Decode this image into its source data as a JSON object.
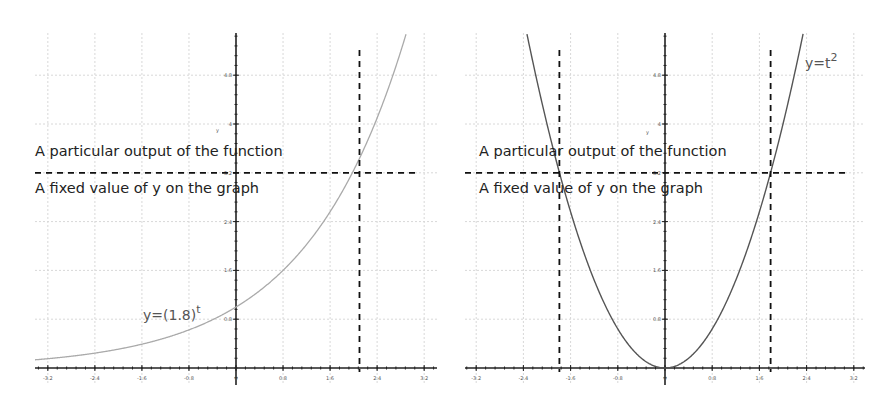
{
  "chart_data": [
    {
      "type": "line",
      "title": "",
      "function_label": "y=(1.8)",
      "function_exponent": "t",
      "xlabel": "",
      "ylabel": "y",
      "x_ticks": [
        "-3.2",
        "-2.4",
        "-1.6",
        "-0.8",
        "0",
        "0.8",
        "1.6",
        "2.4",
        "3.2"
      ],
      "y_ticks": [
        "0.8",
        "1.6",
        "2.4",
        "3.2",
        "4",
        "4.8"
      ],
      "xlim": [
        -4.0,
        4.3
      ],
      "ylim": [
        -0.2,
        6.0
      ],
      "series": [
        {
          "name": "y=(1.8)^t",
          "formula": "1.8^t",
          "color": "#aaaaaa"
        }
      ],
      "horizontal_line": {
        "y": 3.2,
        "style": "dashed"
      },
      "vertical_lines": [
        {
          "x": 2.1,
          "style": "dashed"
        }
      ],
      "annotations": [
        "A particular output of the function",
        "A fixed value of y on the graph"
      ]
    },
    {
      "type": "line",
      "title": "",
      "function_label": "y=t",
      "function_exponent": "2",
      "xlabel": "",
      "ylabel": "y",
      "x_ticks": [
        "-3.2",
        "-2.4",
        "-1.6",
        "-0.8",
        "0",
        "0.8",
        "1.6",
        "2.4",
        "3.2"
      ],
      "y_ticks": [
        "0.8",
        "1.6",
        "2.4",
        "3.2",
        "4",
        "4.8"
      ],
      "xlim": [
        -3.5,
        3.4
      ],
      "ylim": [
        -0.2,
        6.0
      ],
      "series": [
        {
          "name": "y=t^2",
          "formula": "t^2",
          "color": "#555555"
        }
      ],
      "horizontal_line": {
        "y": 3.2,
        "style": "dashed"
      },
      "vertical_lines": [
        {
          "x": -1.79,
          "style": "dashed"
        },
        {
          "x": 1.79,
          "style": "dashed"
        }
      ],
      "annotations": [
        "A particular output of the function",
        "A fixed value of y on the graph"
      ]
    }
  ],
  "left": {
    "annotation_top": "A particular output of the function",
    "annotation_bottom": "A fixed value of y on the graph",
    "fn_label": "y=(1.8)",
    "fn_exp": "t",
    "y_axis_label": "y"
  },
  "right": {
    "annotation_top": "A particular output of the function",
    "annotation_bottom": "A fixed value of y on the graph",
    "fn_label": "y=t",
    "fn_exp": "2",
    "y_axis_label": "y"
  }
}
